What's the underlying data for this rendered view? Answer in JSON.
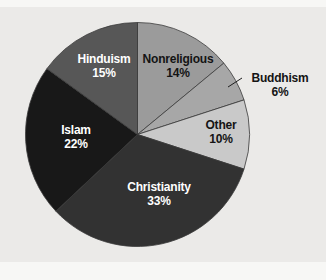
{
  "chart_data": {
    "type": "pie",
    "categories": [
      "Nonreligious",
      "Buddhism",
      "Other",
      "Christianity",
      "Islam",
      "Hinduism"
    ],
    "values": [
      14,
      6,
      10,
      33,
      22,
      15
    ],
    "percent_labels": [
      "14%",
      "6%",
      "10%",
      "33%",
      "22%",
      "15%"
    ],
    "slice_colors": [
      "#9b9b9b",
      "#a7a7a7",
      "#c9c9c9",
      "#323232",
      "#181818",
      "#575757"
    ],
    "label_text_colors": [
      "#141414",
      "#141414",
      "#141414",
      "#ffffff",
      "#ffffff",
      "#ffffff"
    ],
    "label_placement": [
      "inside",
      "outside-with-leader-line",
      "inside",
      "inside",
      "inside",
      "inside"
    ],
    "start_angle": "12-oclock",
    "direction": "clockwise",
    "legend": "none",
    "title": "",
    "outline_color": "#3a3a3a",
    "leader_line_color": "#1e1e1e",
    "panel_background": "#ebeae8"
  }
}
